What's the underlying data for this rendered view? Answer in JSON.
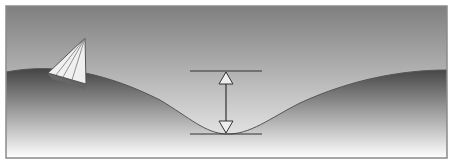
{
  "diagram": {
    "title": "",
    "elements": {
      "frame": {
        "stroke": "#8a8a8a"
      },
      "sky": {
        "top": "#7e7e7e",
        "bottom": "#f2f2f2"
      },
      "sea": {
        "top": "#4a4a4a",
        "bottom": "#ffffff"
      },
      "sailboat": {
        "position": "left crest"
      },
      "height_indicator": {
        "label": "",
        "crest_line_y": 71,
        "trough_line_y": 134,
        "arrow_x": 226
      }
    }
  }
}
